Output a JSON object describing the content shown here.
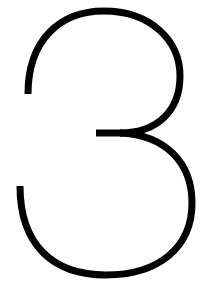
{
  "glyph": {
    "character": "3",
    "stroke_color": "#000000",
    "background_color": "#ffffff"
  }
}
